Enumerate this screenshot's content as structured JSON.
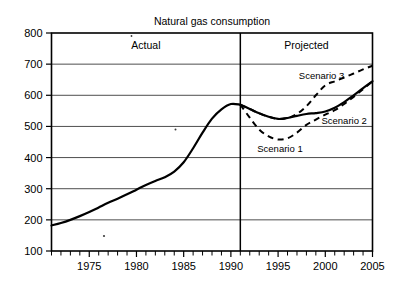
{
  "chart_data": {
    "type": "line",
    "title": "Natural gas consumption",
    "xlabel": "",
    "ylabel": "",
    "xlim": [
      1971,
      2005
    ],
    "ylim": [
      100,
      800
    ],
    "grid": true,
    "grid_axis": "y",
    "legend": "inline-annotations",
    "x_ticks_labeled": [
      "1975",
      "1980",
      "1985",
      "1990",
      "1995",
      "2000",
      "2005"
    ],
    "x_tick_values": [
      1975,
      1980,
      1985,
      1990,
      1995,
      2000,
      2005
    ],
    "x_tick_minor_interval": 1,
    "y_ticks": [
      "100",
      "200",
      "300",
      "400",
      "500",
      "600",
      "700",
      "800"
    ],
    "y_tick_values": [
      100,
      200,
      300,
      400,
      500,
      600,
      700,
      800
    ],
    "regions": [
      {
        "name": "actual-region",
        "label": "Actual",
        "x_start": 1971,
        "x_end": 1991
      },
      {
        "name": "projected-region",
        "label": "Projected",
        "x_start": 1991,
        "x_end": 2005
      }
    ],
    "divider_x": 1991,
    "series": [
      {
        "name": "Actual",
        "style": "solid",
        "x": [
          1971,
          1972,
          1973,
          1974,
          1975,
          1976,
          1977,
          1978,
          1979,
          1980,
          1981,
          1982,
          1983,
          1984,
          1985,
          1986,
          1987,
          1988,
          1989,
          1990,
          1991
        ],
        "values": [
          182,
          190,
          200,
          212,
          225,
          240,
          255,
          268,
          282,
          297,
          312,
          325,
          337,
          355,
          385,
          430,
          480,
          525,
          555,
          572,
          570
        ]
      },
      {
        "name": "Scenario 1",
        "style": "dashed",
        "x": [
          1991,
          1992,
          1993,
          1994,
          1995,
          1996,
          1997,
          1998,
          1999,
          2000,
          2001,
          2002,
          2003,
          2004,
          2005
        ],
        "values": [
          570,
          528,
          490,
          468,
          458,
          462,
          480,
          505,
          522,
          538,
          552,
          572,
          595,
          620,
          645
        ]
      },
      {
        "name": "Scenario 2",
        "style": "solid",
        "x": [
          1991,
          1992,
          1993,
          1994,
          1995,
          1996,
          1997,
          1998,
          1999,
          2000,
          2001,
          2002,
          2003,
          2004,
          2005
        ],
        "values": [
          570,
          556,
          542,
          531,
          524,
          527,
          534,
          540,
          543,
          548,
          560,
          578,
          600,
          623,
          645
        ]
      },
      {
        "name": "Scenario 3",
        "style": "dashed",
        "x": [
          1991,
          1992,
          1993,
          1994,
          1995,
          1996,
          1997,
          1998,
          1999,
          2000,
          2001,
          2002,
          2003,
          2004,
          2005
        ],
        "values": [
          570,
          556,
          542,
          531,
          524,
          527,
          540,
          565,
          600,
          632,
          645,
          657,
          670,
          683,
          695
        ]
      }
    ],
    "annotations": [
      {
        "name": "scenario-1-label",
        "text": "Scenario 1",
        "x": 1995.2,
        "y": 418,
        "anchor": "middle"
      },
      {
        "name": "scenario-2-label",
        "text": "Scenario 2",
        "x": 2002.0,
        "y": 508,
        "anchor": "middle"
      },
      {
        "name": "scenario-3-label",
        "text": "Scenario 3",
        "x": 1999.6,
        "y": 652,
        "anchor": "middle"
      }
    ]
  }
}
